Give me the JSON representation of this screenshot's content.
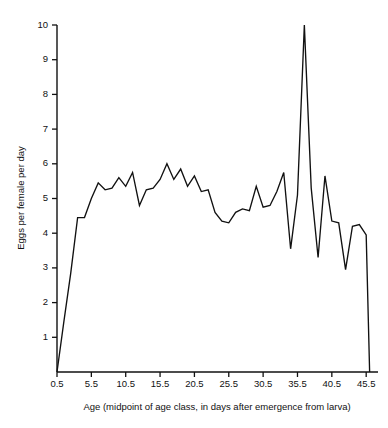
{
  "chart_data": {
    "type": "line",
    "title": "",
    "subtitle": "",
    "xlabel": "Age (midpoint of age class, in days after emergence from larva)",
    "ylabel": "Eggs per female per day",
    "xlim": [
      0.5,
      46.2
    ],
    "ylim": [
      0,
      10
    ],
    "xticks": [
      0.5,
      5.5,
      10.5,
      15.5,
      20.5,
      25.5,
      30.5,
      35.5,
      40.5,
      45.5
    ],
    "xticklabels": [
      "0.5",
      "5.5",
      "10.5",
      "15.5",
      "20.5",
      "25.5",
      "30.5",
      "35.5",
      "40.5",
      "45.5"
    ],
    "yticks": [
      1,
      2,
      3,
      4,
      5,
      6,
      7,
      8,
      9,
      10
    ],
    "yticklabels": [
      "1",
      "2",
      "3",
      "4",
      "5",
      "6",
      "7",
      "8",
      "9",
      "10"
    ],
    "grid": false,
    "legend": false,
    "legend_position": "none",
    "line_color": "#111111",
    "background_color": "#ffffff",
    "axes": {
      "left_spine": true,
      "bottom_spine": true,
      "top_spine": false,
      "right_spine": false
    },
    "x": [
      0.5,
      1.5,
      2.5,
      3.5,
      4.5,
      5.5,
      6.5,
      7.5,
      8.5,
      9.5,
      10.5,
      11.5,
      12.5,
      13.5,
      14.5,
      15.5,
      16.5,
      17.5,
      18.5,
      19.5,
      20.5,
      21.5,
      22.5,
      23.5,
      24.5,
      25.5,
      26.5,
      27.5,
      28.5,
      29.5,
      30.5,
      31.5,
      32.5,
      33.5,
      34.5,
      35.5,
      36.5,
      37.5,
      38.5,
      39.5,
      40.5,
      41.5,
      42.5,
      43.5,
      44.5,
      45.5,
      46.0
    ],
    "y": [
      0.0,
      1.45,
      2.85,
      4.45,
      4.45,
      5.0,
      5.45,
      5.25,
      5.3,
      5.6,
      5.35,
      5.75,
      4.8,
      5.25,
      5.3,
      5.55,
      6.0,
      5.55,
      5.85,
      5.35,
      5.65,
      5.2,
      5.25,
      4.6,
      4.35,
      4.3,
      4.6,
      4.7,
      4.65,
      5.35,
      4.75,
      4.8,
      5.2,
      5.75,
      3.55,
      5.1,
      10.0,
      5.3,
      3.3,
      5.65,
      4.35,
      4.3,
      2.95,
      4.2,
      4.25,
      3.95,
      0.0
    ],
    "series": [
      {
        "name": "Eggs per female per day",
        "values": [
          0.0,
          1.45,
          2.85,
          4.45,
          4.45,
          5.0,
          5.45,
          5.25,
          5.3,
          5.6,
          5.35,
          5.75,
          4.8,
          5.25,
          5.3,
          5.55,
          6.0,
          5.55,
          5.85,
          5.35,
          5.65,
          5.2,
          5.25,
          4.6,
          4.35,
          4.3,
          4.6,
          4.7,
          4.65,
          5.35,
          4.75,
          4.8,
          5.2,
          5.75,
          3.55,
          5.1,
          10.0,
          5.3,
          3.3,
          5.65,
          4.35,
          4.3,
          2.95,
          4.2,
          4.25,
          3.95,
          0.0
        ]
      }
    ],
    "annotations": []
  }
}
